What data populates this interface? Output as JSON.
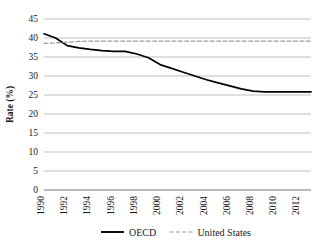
{
  "chart_data": {
    "type": "line",
    "title": "",
    "xlabel": "",
    "ylabel": "Rate (%)",
    "ylim": [
      0,
      45
    ],
    "xlim": [
      1990,
      2013
    ],
    "grid": true,
    "legend_position": "bottom",
    "y_ticks": [
      "0",
      "5",
      "10",
      "15",
      "20",
      "25",
      "30",
      "35",
      "40",
      "45"
    ],
    "y_tick_values": [
      0,
      5,
      10,
      15,
      20,
      25,
      30,
      35,
      40,
      45
    ],
    "x_ticks": [
      "1990",
      "1992",
      "1994",
      "1996",
      "1998",
      "2000",
      "2002",
      "2004",
      "2006",
      "2008",
      "2010",
      "2012"
    ],
    "x_tick_values": [
      1990,
      1992,
      1994,
      1996,
      1998,
      2000,
      2002,
      2004,
      2006,
      2008,
      2010,
      2012
    ],
    "x": [
      1990,
      1991,
      1992,
      1993,
      1994,
      1995,
      1996,
      1997,
      1998,
      1999,
      2000,
      2001,
      2002,
      2003,
      2004,
      2005,
      2006,
      2007,
      2008,
      2009,
      2010,
      2011,
      2012,
      2013
    ],
    "series": [
      {
        "name": "OECD",
        "style": "solid",
        "color": "#000000",
        "values": [
          41.1,
          40.0,
          38.0,
          37.4,
          37.0,
          36.7,
          36.5,
          36.5,
          35.8,
          34.8,
          33.0,
          32.0,
          31.0,
          30.0,
          29.0,
          28.2,
          27.4,
          26.6,
          26.0,
          25.8,
          25.8,
          25.8,
          25.8,
          25.8
        ]
      },
      {
        "name": "United States",
        "style": "dashed",
        "color": "#9a9a9a",
        "values": [
          38.6,
          38.7,
          38.9,
          39.1,
          39.2,
          39.2,
          39.2,
          39.2,
          39.2,
          39.2,
          39.2,
          39.2,
          39.2,
          39.2,
          39.2,
          39.2,
          39.2,
          39.2,
          39.2,
          39.2,
          39.2,
          39.2,
          39.2,
          39.2
        ]
      }
    ],
    "legend": [
      {
        "label": "OECD",
        "style": "solid",
        "color": "#000000"
      },
      {
        "label": "United States",
        "style": "dashed",
        "color": "#9a9a9a"
      }
    ]
  }
}
